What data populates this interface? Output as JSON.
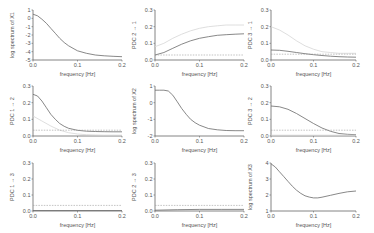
{
  "chart_data": [
    {
      "type": "line",
      "row": 0,
      "col": 0,
      "ylabel": "log spectrum of X1",
      "xlabel": "frequency [Hz]",
      "xlim": [
        0,
        0.2
      ],
      "ylim": [
        -5,
        1
      ],
      "xticks": [
        "0.0",
        "0.1",
        "0.2"
      ],
      "yticks": [
        "1",
        "0",
        "-1",
        "-2",
        "-3",
        "-4",
        "-5"
      ],
      "series": [
        {
          "name": "spectrum",
          "style": "solid",
          "x": [
            0,
            0.01,
            0.02,
            0.03,
            0.04,
            0.05,
            0.06,
            0.07,
            0.08,
            0.09,
            0.1,
            0.12,
            0.14,
            0.16,
            0.18,
            0.2
          ],
          "values": [
            0.5,
            0.3,
            -0.1,
            -0.6,
            -1.2,
            -1.8,
            -2.4,
            -2.9,
            -3.3,
            -3.6,
            -3.9,
            -4.2,
            -4.4,
            -4.5,
            -4.55,
            -4.6
          ]
        }
      ]
    },
    {
      "type": "line",
      "row": 0,
      "col": 1,
      "ylabel": "PDC 2 → 1",
      "xlabel": "frequency [Hz]",
      "xlim": [
        0,
        0.2
      ],
      "ylim": [
        0,
        0.3
      ],
      "xticks": [
        "0.0",
        "0.1",
        "0.2"
      ],
      "yticks": [
        "0.3",
        "0.2",
        "0.1",
        "0.0"
      ],
      "series": [
        {
          "name": "PDC",
          "style": "solid",
          "x": [
            0,
            0.02,
            0.04,
            0.06,
            0.08,
            0.1,
            0.12,
            0.14,
            0.16,
            0.18,
            0.2
          ],
          "values": [
            0.03,
            0.045,
            0.07,
            0.095,
            0.115,
            0.13,
            0.14,
            0.148,
            0.152,
            0.155,
            0.157
          ]
        },
        {
          "name": "upper bound",
          "style": "light",
          "x": [
            0,
            0.02,
            0.04,
            0.06,
            0.08,
            0.1,
            0.12,
            0.14,
            0.16,
            0.18,
            0.2
          ],
          "values": [
            0.08,
            0.1,
            0.13,
            0.155,
            0.175,
            0.19,
            0.2,
            0.205,
            0.21,
            0.21,
            0.21
          ]
        },
        {
          "name": "significance threshold",
          "style": "dashed",
          "x": [
            0,
            0.2
          ],
          "values": [
            0.03,
            0.03
          ]
        }
      ]
    },
    {
      "type": "line",
      "row": 0,
      "col": 2,
      "ylabel": "PDC 3 → 1",
      "xlabel": "frequency [Hz]",
      "xlim": [
        0,
        0.2
      ],
      "ylim": [
        0,
        0.3
      ],
      "xticks": [
        "0.0",
        "0.1",
        "0.2"
      ],
      "yticks": [
        "0.3",
        "0.2",
        "0.1",
        "0.0"
      ],
      "series": [
        {
          "name": "PDC",
          "style": "solid",
          "x": [
            0,
            0.02,
            0.04,
            0.06,
            0.08,
            0.1,
            0.12,
            0.14,
            0.16,
            0.18,
            0.2
          ],
          "values": [
            0.06,
            0.058,
            0.052,
            0.045,
            0.038,
            0.032,
            0.027,
            0.023,
            0.02,
            0.018,
            0.017
          ]
        },
        {
          "name": "upper bound",
          "style": "light",
          "x": [
            0,
            0.02,
            0.04,
            0.06,
            0.08,
            0.1,
            0.12,
            0.14,
            0.16,
            0.18,
            0.2
          ],
          "values": [
            0.2,
            0.18,
            0.15,
            0.115,
            0.085,
            0.065,
            0.05,
            0.045,
            0.04,
            0.04,
            0.04
          ]
        },
        {
          "name": "significance threshold",
          "style": "dashed",
          "x": [
            0,
            0.2
          ],
          "values": [
            0.035,
            0.035
          ]
        }
      ]
    },
    {
      "type": "line",
      "row": 1,
      "col": 0,
      "ylabel": "PDC 1 → 2",
      "xlabel": "frequency [Hz]",
      "xlim": [
        0,
        0.2
      ],
      "ylim": [
        0,
        0.3
      ],
      "xticks": [
        "0.0",
        "0.1",
        "0.2"
      ],
      "yticks": [
        "0.3",
        "0.2",
        "0.1",
        "0.0"
      ],
      "series": [
        {
          "name": "PDC",
          "style": "solid",
          "x": [
            0,
            0.01,
            0.02,
            0.03,
            0.04,
            0.05,
            0.06,
            0.07,
            0.08,
            0.1,
            0.12,
            0.14,
            0.16,
            0.18,
            0.2
          ],
          "values": [
            0.25,
            0.24,
            0.21,
            0.17,
            0.13,
            0.1,
            0.075,
            0.058,
            0.046,
            0.034,
            0.029,
            0.027,
            0.026,
            0.025,
            0.025
          ]
        },
        {
          "name": "lower bound",
          "style": "light",
          "x": [
            0,
            0.02,
            0.04,
            0.06,
            0.08,
            0.1,
            0.12,
            0.14,
            0.16,
            0.18,
            0.2
          ],
          "values": [
            0.12,
            0.09,
            0.06,
            0.035,
            0.02,
            0.012,
            0.008,
            0.006,
            0.005,
            0.005,
            0.005
          ]
        },
        {
          "name": "significance threshold",
          "style": "dashed",
          "x": [
            0,
            0.2
          ],
          "values": [
            0.035,
            0.035
          ]
        }
      ]
    },
    {
      "type": "line",
      "row": 1,
      "col": 1,
      "ylabel": "log spectrum of X2",
      "xlabel": "frequency [Hz]",
      "xlim": [
        0,
        0.2
      ],
      "ylim": [
        -2,
        1
      ],
      "xticks": [
        "0.0",
        "0.1",
        "0.2"
      ],
      "yticks": [
        "1",
        "0",
        "-1",
        "-2"
      ],
      "series": [
        {
          "name": "spectrum",
          "style": "solid",
          "x": [
            0,
            0.01,
            0.02,
            0.03,
            0.04,
            0.05,
            0.06,
            0.07,
            0.08,
            0.09,
            0.1,
            0.12,
            0.14,
            0.16,
            0.18,
            0.2
          ],
          "values": [
            0.75,
            0.75,
            0.75,
            0.7,
            0.45,
            0.05,
            -0.35,
            -0.7,
            -1.0,
            -1.2,
            -1.35,
            -1.55,
            -1.63,
            -1.67,
            -1.68,
            -1.68
          ]
        }
      ]
    },
    {
      "type": "line",
      "row": 1,
      "col": 2,
      "ylabel": "PDC 3 → 2",
      "xlabel": "frequency [Hz]",
      "xlim": [
        0,
        0.2
      ],
      "ylim": [
        0,
        0.3
      ],
      "xticks": [
        "0.0",
        "0.1",
        "0.2"
      ],
      "yticks": [
        "0.3",
        "0.2",
        "0.1",
        "0.0"
      ],
      "series": [
        {
          "name": "PDC",
          "style": "solid",
          "x": [
            0,
            0.02,
            0.04,
            0.06,
            0.08,
            0.1,
            0.12,
            0.14,
            0.16,
            0.18,
            0.2
          ],
          "values": [
            0.18,
            0.175,
            0.16,
            0.135,
            0.105,
            0.075,
            0.048,
            0.028,
            0.015,
            0.01,
            0.008
          ]
        },
        {
          "name": "lower bound",
          "style": "light",
          "x": [
            0,
            0.04,
            0.08,
            0.12,
            0.16,
            0.2
          ],
          "values": [
            0.005,
            0.005,
            0.005,
            0.005,
            0.005,
            0.005
          ]
        },
        {
          "name": "significance threshold",
          "style": "dashed",
          "x": [
            0,
            0.2
          ],
          "values": [
            0.035,
            0.035
          ]
        }
      ]
    },
    {
      "type": "line",
      "row": 2,
      "col": 0,
      "ylabel": "PDC 1 → 3",
      "xlabel": "frequency [Hz]",
      "xlim": [
        0,
        0.2
      ],
      "ylim": [
        0,
        0.3
      ],
      "xticks": [
        "0.0",
        "0.1",
        "0.2"
      ],
      "yticks": [
        "0.3",
        "0.2",
        "0.1",
        "0.0"
      ],
      "series": [
        {
          "name": "PDC",
          "style": "solid",
          "x": [
            0,
            0.2
          ],
          "values": [
            0.003,
            0.003
          ]
        },
        {
          "name": "significance threshold",
          "style": "dashed",
          "x": [
            0,
            0.2
          ],
          "values": [
            0.035,
            0.035
          ]
        }
      ]
    },
    {
      "type": "line",
      "row": 2,
      "col": 1,
      "ylabel": "PDC 2 → 3",
      "xlabel": "frequency [Hz]",
      "xlim": [
        0,
        0.2
      ],
      "ylim": [
        0,
        0.3
      ],
      "xticks": [
        "0.0",
        "0.1",
        "0.2"
      ],
      "yticks": [
        "0.3",
        "0.2",
        "0.1",
        "0.0"
      ],
      "series": [
        {
          "name": "PDC",
          "style": "solid",
          "x": [
            0,
            0.05,
            0.1,
            0.15,
            0.2
          ],
          "values": [
            0.005,
            0.008,
            0.01,
            0.01,
            0.01
          ]
        },
        {
          "name": "significance threshold",
          "style": "dashed",
          "x": [
            0,
            0.2
          ],
          "values": [
            0.035,
            0.035
          ]
        }
      ]
    },
    {
      "type": "line",
      "row": 2,
      "col": 2,
      "ylabel": "log spectrum of X3",
      "xlabel": "frequency [Hz]",
      "xlim": [
        0,
        0.2
      ],
      "ylim": [
        1,
        4
      ],
      "xticks": [
        "0.0",
        "0.1",
        "0.2"
      ],
      "yticks": [
        "4",
        "3",
        "2",
        "1"
      ],
      "series": [
        {
          "name": "spectrum",
          "style": "solid",
          "x": [
            0,
            0.01,
            0.02,
            0.03,
            0.04,
            0.05,
            0.06,
            0.07,
            0.08,
            0.09,
            0.1,
            0.11,
            0.12,
            0.14,
            0.16,
            0.18,
            0.2
          ],
          "values": [
            3.95,
            3.75,
            3.45,
            3.15,
            2.85,
            2.55,
            2.3,
            2.1,
            1.95,
            1.87,
            1.82,
            1.82,
            1.86,
            1.98,
            2.1,
            2.2,
            2.25
          ]
        }
      ]
    }
  ]
}
